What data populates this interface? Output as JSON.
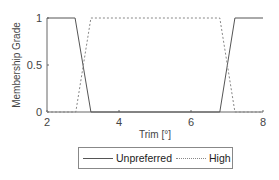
{
  "chart_data": {
    "type": "line",
    "title": "",
    "xlabel": "Trim [°]",
    "ylabel": "Membership Grade",
    "xlim": [
      2,
      8
    ],
    "ylim": [
      0,
      1
    ],
    "xticks": [
      2,
      4,
      6,
      8
    ],
    "yticks": [
      0,
      0.5,
      1
    ],
    "xtick_labels": [
      "2",
      "4",
      "6",
      "8"
    ],
    "ytick_labels": [
      "0",
      "0.5",
      "1"
    ],
    "grid": false,
    "legend_position": "bottom-outside",
    "series": [
      {
        "name": "Unpreferred",
        "style": "solid",
        "color": "#555555",
        "x": [
          2,
          2.78,
          3.22,
          6.8,
          7.22,
          8
        ],
        "y": [
          1,
          1,
          0,
          0,
          1,
          1
        ]
      },
      {
        "name": "High",
        "style": "dotted",
        "color": "#888888",
        "x": [
          2,
          2.8,
          3.22,
          6.8,
          7.22,
          8
        ],
        "y": [
          0,
          0,
          1,
          1,
          0,
          0
        ]
      }
    ]
  },
  "legend": {
    "items": [
      {
        "label": "Unpreferred"
      },
      {
        "label": "High"
      }
    ]
  }
}
